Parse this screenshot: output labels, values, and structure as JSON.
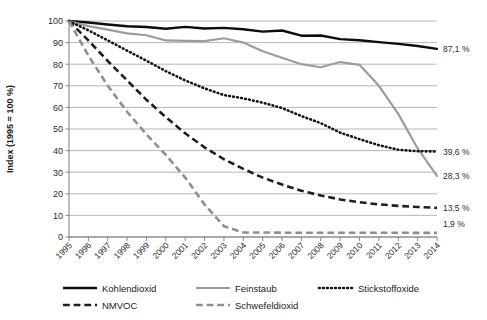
{
  "chart_data": {
    "type": "line",
    "title": "",
    "xlabel": "",
    "ylabel": "Index (1995 = 100 %)",
    "ylim": [
      0,
      100
    ],
    "ytick_step": 10,
    "yticks": [
      "0",
      "10",
      "20",
      "30",
      "40",
      "50",
      "60",
      "70",
      "80",
      "90",
      "100"
    ],
    "grid": true,
    "legend_position": "bottom",
    "x": [
      "1995",
      "1996",
      "1997",
      "1998",
      "1999",
      "2000",
      "2001",
      "2002",
      "2003",
      "2004",
      "2005",
      "2006",
      "2007",
      "2008",
      "2009",
      "2010",
      "2011",
      "2012",
      "2013",
      "2014"
    ],
    "categories": [
      "1995",
      "1996",
      "1997",
      "1998",
      "1999",
      "2000",
      "2001",
      "2002",
      "2003",
      "2004",
      "2005",
      "2006",
      "2007",
      "2008",
      "2009",
      "2010",
      "2011",
      "2012",
      "2013",
      "2014"
    ],
    "series": [
      {
        "name": "Kohlendioxid",
        "style": "solid",
        "color": "#0d0d0d",
        "width": 2.4,
        "end_label": "87,1 %",
        "values": [
          100.0,
          99.3,
          98.4,
          97.6,
          97.2,
          96.4,
          97.3,
          96.5,
          96.8,
          96.2,
          95.1,
          95.6,
          93.2,
          93.3,
          91.6,
          91.1,
          90.2,
          89.4,
          88.4,
          87.1
        ]
      },
      {
        "name": "Feinstaub",
        "style": "solid",
        "color": "#9c9c9c",
        "width": 2.2,
        "end_label": "28,3 %",
        "values": [
          100.0,
          97.6,
          96.0,
          94.3,
          93.4,
          91.0,
          90.8,
          90.7,
          92.0,
          90.0,
          86.0,
          83.0,
          80.0,
          78.6,
          81.0,
          79.7,
          70.0,
          57.0,
          41.0,
          28.3
        ]
      },
      {
        "name": "Stickstoffoxide",
        "style": "dotted",
        "color": "#141414",
        "width": 2.6,
        "end_label": "39,6 %",
        "values": [
          100.0,
          95.7,
          91.0,
          86.3,
          81.6,
          76.8,
          72.5,
          68.8,
          65.7,
          64.2,
          62.2,
          59.7,
          56.0,
          52.7,
          48.3,
          45.3,
          42.5,
          40.4,
          39.7,
          39.6
        ]
      },
      {
        "name": "NMVOC",
        "style": "dashed",
        "color": "#1f1f1f",
        "width": 2.6,
        "end_label": "13,5 %",
        "values": [
          100.0,
          91.0,
          81.5,
          72.5,
          63.5,
          55.5,
          48.0,
          41.5,
          36.0,
          31.5,
          27.5,
          24.3,
          21.4,
          19.2,
          17.4,
          16.1,
          15.1,
          14.4,
          13.9,
          13.5
        ]
      },
      {
        "name": "Schwefeldioxid",
        "style": "dashed",
        "color": "#8f8f8f",
        "width": 2.6,
        "end_label": "1,9 %",
        "values": [
          100.0,
          84.0,
          70.0,
          58.0,
          47.5,
          38.0,
          27.5,
          15.0,
          5.0,
          2.1,
          2.1,
          2.0,
          2.0,
          2.0,
          2.0,
          2.0,
          2.0,
          2.0,
          1.9,
          1.9
        ]
      }
    ],
    "end_labels": [
      "87,1 %",
      "39,6 %",
      "28,3 %",
      "13,5 %",
      "1,9 %"
    ],
    "legend": [
      {
        "label": "Kohlendioxid",
        "style": "solid",
        "color": "#0d0d0d"
      },
      {
        "label": "Feinstaub",
        "style": "solid",
        "color": "#9c9c9c"
      },
      {
        "label": "Stickstoffoxide",
        "style": "dotted",
        "color": "#141414"
      },
      {
        "label": "NMVOC",
        "style": "dashed",
        "color": "#1f1f1f"
      },
      {
        "label": "Schwefeldioxid",
        "style": "dashed",
        "color": "#8f8f8f"
      }
    ]
  }
}
